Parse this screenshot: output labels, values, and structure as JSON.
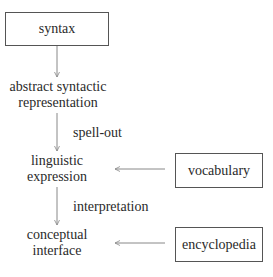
{
  "diagram": {
    "nodes": {
      "syntax": "syntax",
      "abstract_line1": "abstract syntactic",
      "abstract_line2": "representation",
      "linguistic_line1": "linguistic",
      "linguistic_line2": "expression",
      "conceptual_line1": "conceptual",
      "conceptual_line2": "interface",
      "vocabulary": "vocabulary",
      "encyclopedia": "encyclopedia"
    },
    "edges": [
      {
        "from": "syntax",
        "to": "abstract syntactic representation",
        "label": ""
      },
      {
        "from": "abstract syntactic representation",
        "to": "linguistic expression",
        "label": "spell-out"
      },
      {
        "from": "linguistic expression",
        "to": "conceptual interface",
        "label": "interpretation"
      },
      {
        "from": "vocabulary",
        "to": "linguistic expression",
        "label": ""
      },
      {
        "from": "encyclopedia",
        "to": "conceptual interface",
        "label": ""
      }
    ],
    "labels": {
      "spell_out": "spell-out",
      "interpretation": "interpretation"
    },
    "colors": {
      "line": "#888888",
      "box_border": "#555555",
      "text": "#2a2a2a"
    }
  }
}
